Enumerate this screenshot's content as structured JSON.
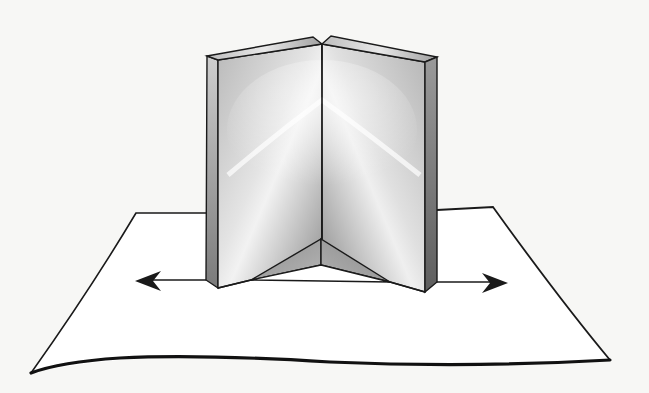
{
  "figure": {
    "elements": {
      "paper_sheet": "paper-sheet",
      "left_mirror": "left-mirror",
      "right_mirror": "right-mirror",
      "hinge": "hinge-line",
      "base_triangle": "mirror-base-triangle",
      "left_arrow": "left-direction-arrow",
      "right_arrow": "right-direction-arrow"
    },
    "colors": {
      "background": "#f7f7f5",
      "ink": "#1a1a1a",
      "mirror_light": "#e6e6e6",
      "mirror_mid": "#a8a8a8",
      "mirror_dark": "#6a6a6a",
      "paper": "#ffffff"
    }
  }
}
